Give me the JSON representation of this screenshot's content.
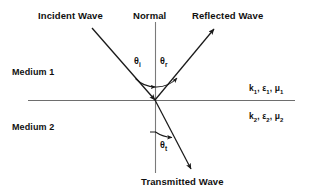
{
  "diagram": {
    "title_absent": true,
    "labels": {
      "incident_wave": "Incident Wave",
      "normal": "Normal",
      "reflected_wave": "Reflected Wave",
      "transmitted_wave": "Transmitted Wave",
      "medium_1": "Medium 1",
      "medium_2": "Medium 2"
    },
    "angles": {
      "theta_i_symbol": "θ",
      "theta_i_sub": "i",
      "theta_r_symbol": "θ",
      "theta_r_sub": "r",
      "theta_t_symbol": "θ",
      "theta_t_sub": "t"
    },
    "parameters": {
      "medium1": {
        "k_symbol": "k",
        "k_sub": "1",
        "eps_symbol": "ε",
        "eps_sub": "1",
        "mu_symbol": "μ",
        "mu_sub": "1",
        "separator": ", "
      },
      "medium2": {
        "k_symbol": "k",
        "k_sub": "2",
        "eps_symbol": "ε",
        "eps_sub": "2",
        "mu_symbol": "μ",
        "mu_sub": "2",
        "separator": ", "
      }
    },
    "colors": {
      "background": "#ffffff",
      "line": "#3a3a3a",
      "ray": "#1a1a1a",
      "text": "#101010"
    }
  }
}
